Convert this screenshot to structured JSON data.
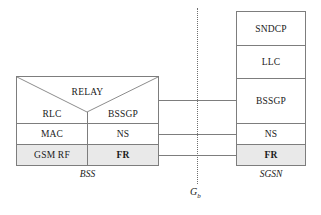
{
  "diagram": {
    "accent_shade": "#e9e9e9",
    "line_color": "#7d7d7d"
  },
  "bss": {
    "caption": "BSS",
    "relay_label": "RELAY",
    "left_column": [
      {
        "label": "RLC"
      },
      {
        "label": "MAC"
      },
      {
        "label": "GSM RF"
      }
    ],
    "right_column": [
      {
        "label": "BSSGP"
      },
      {
        "label": "NS"
      },
      {
        "label": "FR"
      }
    ]
  },
  "sgsn": {
    "caption": "SGSN",
    "layers": [
      {
        "label": "SNDCP"
      },
      {
        "label": "LLC"
      },
      {
        "label": "BSSGP"
      },
      {
        "label": "NS"
      },
      {
        "label": "FR"
      }
    ]
  },
  "interface": {
    "label": "G",
    "subscript": "b"
  }
}
